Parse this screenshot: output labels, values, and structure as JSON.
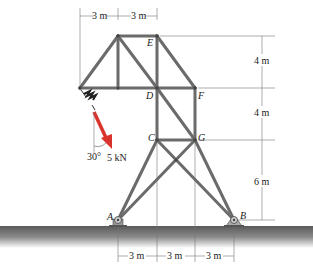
{
  "diagram": {
    "type": "truss",
    "nodes": [
      {
        "id": "A",
        "label": "A"
      },
      {
        "id": "B",
        "label": "B"
      },
      {
        "id": "C",
        "label": "C"
      },
      {
        "id": "D",
        "label": "D"
      },
      {
        "id": "E",
        "label": "E"
      },
      {
        "id": "F",
        "label": "F"
      },
      {
        "id": "G",
        "label": "G"
      }
    ],
    "load": {
      "magnitude": "5 kN",
      "angle": "30°",
      "color": "#d9342b"
    },
    "dimensions": {
      "top": [
        "3 m",
        "3 m"
      ],
      "right": [
        "4 m",
        "4 m",
        "6 m"
      ],
      "bottom": [
        "3 m",
        "3 m",
        "3 m"
      ]
    }
  }
}
